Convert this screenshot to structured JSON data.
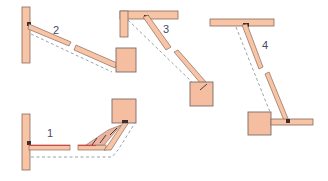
{
  "diagram": {
    "type": "mechanism-positions",
    "labels": [
      "1",
      "2",
      "3",
      "4"
    ],
    "colors": {
      "wood": "#f7c4a6",
      "block": "#f6bea0",
      "outline": "#8a6a5a",
      "dashed_path": "#8a97a8",
      "highlight": "#e04040",
      "label": "#4a4a66"
    },
    "positions": [
      {
        "id": "1",
        "label": "1",
        "description": "Horizontal arm with triangular braced link rising to block at upper right"
      },
      {
        "id": "2",
        "label": "2",
        "description": "Vertical post with diagonal arm descending to block at lower right"
      },
      {
        "id": "3",
        "label": "3",
        "description": "L-shaped frame with diagonal arm descending to block"
      },
      {
        "id": "4",
        "label": "4",
        "description": "Horizontal beam with near-vertical arm descending to block with horizontal bar"
      }
    ]
  }
}
